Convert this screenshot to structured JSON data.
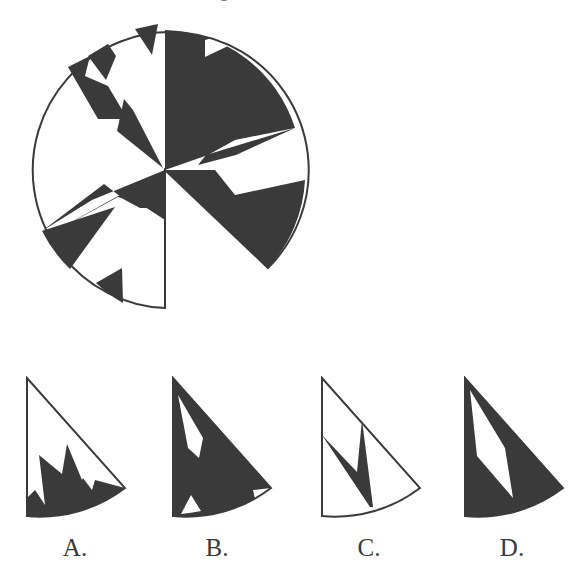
{
  "question": {
    "stem_fragment": "g",
    "colors": {
      "ink": "#3a3a3a",
      "paper": "#ffffff"
    }
  },
  "main_figure": {
    "description": "Circle with a missing sector (lower-left quadrant region between 6 o'clock and ~4:30), divided into black and white polygonal regions",
    "center": [
      165,
      170
    ],
    "radius": 138,
    "missing_sector_note": "sector from angle pointing down (x=165,y=308) to angle toward (268,268) is blank",
    "outline_path": "M165,170 L165,308 A138,138 0 1 1 268,268 Z",
    "black_regions": [
      "M165,170 L165,30 A140,140 0 0 1 295,128 L235,140 L208,155 Z",
      "M206,155 L295,128 L236,155 L198,165 Z",
      "M165,170 L215,170 L235,195 L305,180 A140,140 0 0 1 268,268 Z",
      "M68,67 L90,56 L85,76 L108,86 L124,113 L122,119 L98,119 Z",
      "M117,131 L124,99 L133,110 L163,168 Z",
      "M88,56 L108,44 L116,56 L106,80 Z",
      "M135,29 L158,24 L152,55 Z",
      "M165,170 L165,208 L140,208 L125,200 L104,184 L42,231 L115,207 L70,269 A140,140 0 0 1 42,231 L92,200 Z",
      "M165,170 L165,220 L142,205 L118,197 L46,236 Z",
      "M96,283 L122,268 L123,303 A140,140 0 0 1 96,283 Z"
    ],
    "white_cutouts": [
      "M205,40 L220,36 L228,46 L205,57 Z"
    ]
  },
  "options": [
    {
      "id": "A",
      "label": "A.",
      "origin": [
        27,
        378
      ],
      "description": "Mostly white sector with black sawtooth along the arc",
      "outline_path": "M0,0 L0,138 A140,140 0 0 0 98,110 Z",
      "black_path": "M0,138 L0,120 L8,112 L18,127 L12,77 L35,96 L40,66 L55,102 L56,100 L65,112 L68,102 L98,110 A140,140 0 0 1 0,138 Z",
      "white_path": ""
    },
    {
      "id": "B",
      "label": "B.",
      "origin": [
        173,
        378
      ],
      "description": "Black sector with white cutouts: elongated polygon near top, two small triangles near arc",
      "outline_path": "M0,0 L0,138 A140,140 0 0 0 98,110 Z",
      "black_path": "M0,0 L98,110 A140,140 0 0 1 0,138 Z",
      "white_path": [
        "M5,17 L30,60 L26,80 L15,70 Z",
        "M8,136 L18,117 L28,133 A140,140 0 0 1 8,136 Z",
        "M80,112 L98,110 L82,121 Z"
      ]
    },
    {
      "id": "C",
      "label": "C.",
      "origin": [
        322,
        378
      ],
      "description": "White sector with thin black V/arrow shape",
      "outline_path": "M0,0 L0,138 A140,140 0 0 0 98,110 Z",
      "black_path": "M0,57 L35,94 L40,42 L51,129 L48,129 Z",
      "white_path": ""
    },
    {
      "id": "D",
      "label": "D.",
      "origin": [
        465,
        378
      ],
      "description": "Black sector with a long white parallelogram slit",
      "outline_path": "M0,0 L0,138 A140,140 0 0 0 98,110 Z",
      "black_path": "M0,0 L98,110 A140,140 0 0 1 0,138 Z",
      "white_path": [
        "M5,12 L40,70 L48,120 L12,78 Z"
      ]
    }
  ],
  "labels": {
    "A": "A.",
    "B": "B.",
    "C": "C.",
    "D": "D."
  }
}
